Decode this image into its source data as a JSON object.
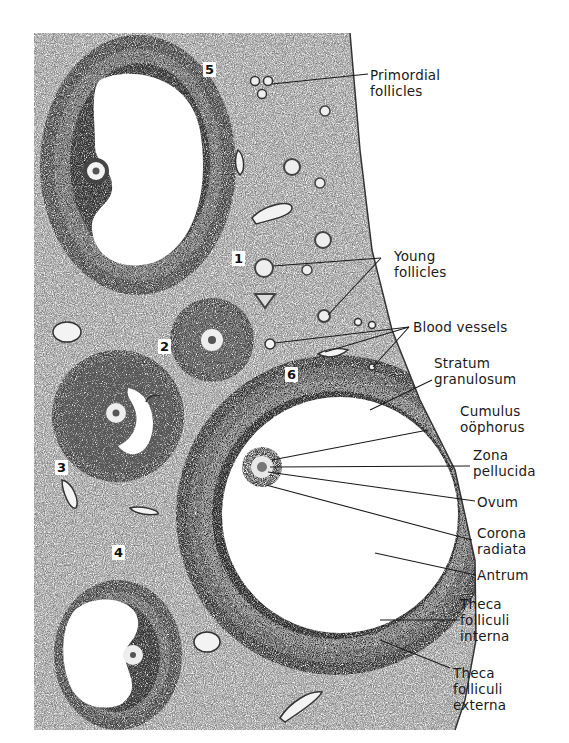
{
  "figure": {
    "background_color": "#ffffff",
    "tissue_color": "#9a9a9a",
    "line_color": "#1a1a1a"
  },
  "numbered_markers": [
    {
      "id": "1",
      "text": "1"
    },
    {
      "id": "2",
      "text": "2"
    },
    {
      "id": "3",
      "text": "3"
    },
    {
      "id": "4",
      "text": "4"
    },
    {
      "id": "5",
      "text": "5"
    },
    {
      "id": "6",
      "text": "6"
    }
  ],
  "labels": {
    "primordial_follicles": {
      "line1": "Primordial",
      "line2": "follicles"
    },
    "young_follicles": {
      "line1": "Young",
      "line2": "follicles"
    },
    "blood_vessels": {
      "line1": "Blood vessels"
    },
    "stratum_granulosum": {
      "line1": "Stratum",
      "line2": "granulosum"
    },
    "cumulus_oophorus": {
      "line1": "Cumulus",
      "line2": "oöphorus"
    },
    "zona_pellucida": {
      "line1": "Zona",
      "line2": "pellucida"
    },
    "ovum": {
      "line1": "Ovum"
    },
    "corona_radiata": {
      "line1": "Corona",
      "line2": "radiata"
    },
    "antrum": {
      "line1": "Antrum"
    },
    "theca_interna": {
      "line1": "Theca",
      "line2": "folliculi",
      "line3": "interna"
    },
    "theca_externa": {
      "line1": "Theca",
      "line2": "folliculi",
      "line3": "externa"
    }
  }
}
